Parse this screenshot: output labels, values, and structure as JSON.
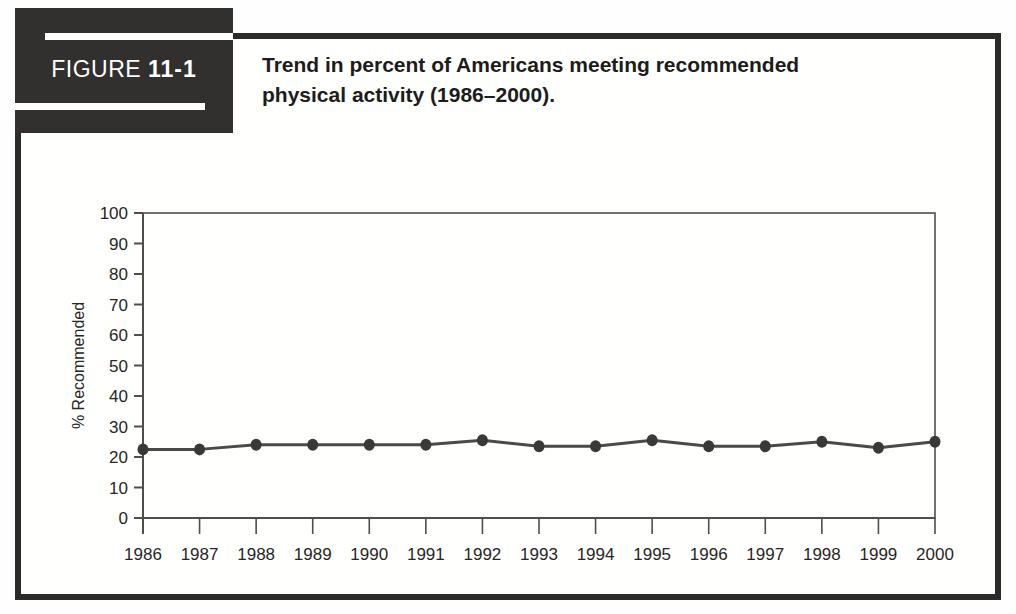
{
  "figure_label": {
    "prefix": "FIGURE",
    "number": "11-1"
  },
  "title": "Trend in percent of Americans meeting recommended physical activity (1986–2000).",
  "colors": {
    "frame": "#2c2b2a",
    "header_box": "#31302e",
    "header_text": "#ffffff",
    "title_text": "#1d1c1a",
    "axis": "#4f4e4d",
    "line": "#4b4a49",
    "point": "#3a3938",
    "tick_label": "#272625"
  },
  "chart_data": {
    "type": "line",
    "title": "",
    "xlabel": "",
    "ylabel": "% Recommended",
    "categories": [
      "1986",
      "1987",
      "1988",
      "1989",
      "1990",
      "1991",
      "1992",
      "1993",
      "1994",
      "1995",
      "1996",
      "1997",
      "1998",
      "1999",
      "2000"
    ],
    "series": [
      {
        "name": "% meeting recommended physical activity",
        "values": [
          22.5,
          22.5,
          24,
          24,
          24,
          24,
          25.5,
          23.5,
          23.5,
          25.5,
          23.5,
          23.5,
          25,
          23,
          25
        ]
      }
    ],
    "ylim": [
      0,
      100
    ],
    "ytick_step": 10,
    "grid": false,
    "legend": "none",
    "plot_border": "full-box",
    "marker": "filled-circle"
  }
}
